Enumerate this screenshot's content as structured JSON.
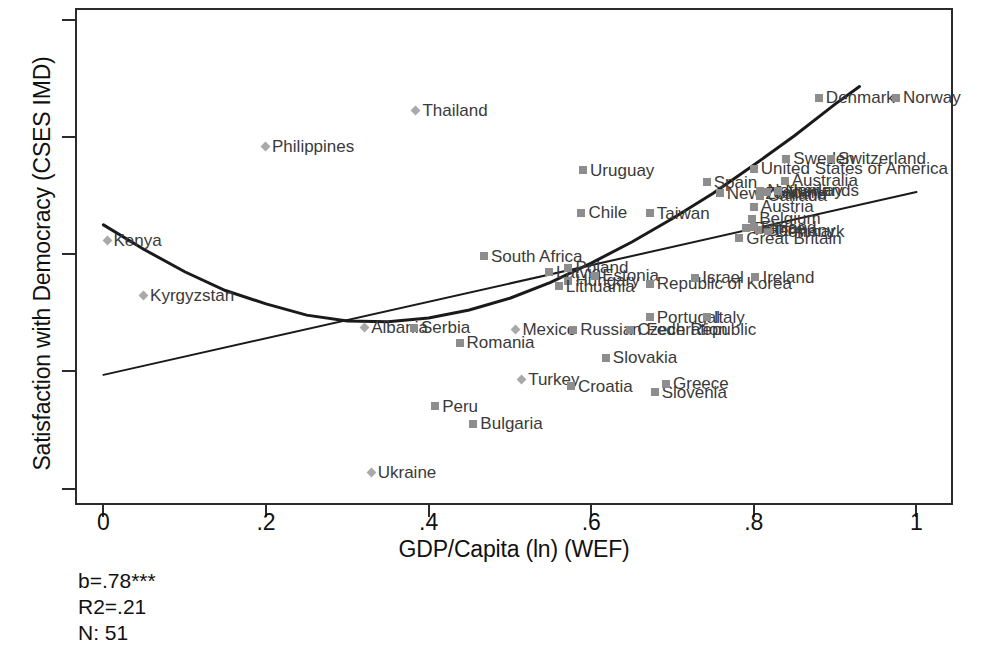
{
  "chart_data": {
    "type": "scatter",
    "title": "",
    "xlabel": "GDP/Capita (ln) (WEF)",
    "ylabel": "Satisfaction with Democracy (CSES IMD)",
    "xlim": [
      -0.035,
      1.045
    ],
    "ylim": [
      1.43,
      3.55
    ],
    "xticks": [
      "0",
      ".2",
      ".4",
      ".6",
      ".8",
      "1"
    ],
    "xtick_values": [
      0,
      0.2,
      0.4,
      0.6,
      0.8,
      1.0
    ],
    "yticks": [
      "1.5",
      "2",
      "2.5",
      "3",
      "3.5"
    ],
    "ytick_values": [
      1.5,
      2.0,
      2.5,
      3.0,
      3.5
    ],
    "grid": false,
    "legend": null,
    "marker_types": [
      "square",
      "diamond"
    ],
    "points": [
      {
        "label": "Kenya",
        "x": 0.005,
        "y": 2.555,
        "marker": "diamond",
        "label_pos": "right"
      },
      {
        "label": "Kyrgyzstan",
        "x": 0.05,
        "y": 2.32,
        "marker": "diamond",
        "label_pos": "right"
      },
      {
        "label": "Philippines",
        "x": 0.2,
        "y": 2.955,
        "marker": "diamond",
        "label_pos": "right"
      },
      {
        "label": "Thailand",
        "x": 0.385,
        "y": 3.11,
        "marker": "diamond",
        "label_pos": "right"
      },
      {
        "label": "Albania",
        "x": 0.322,
        "y": 2.185,
        "marker": "diamond",
        "label_pos": "right"
      },
      {
        "label": "Serbia",
        "x": 0.382,
        "y": 2.185,
        "marker": "square",
        "label_pos": "right"
      },
      {
        "label": "Romania",
        "x": 0.438,
        "y": 2.12,
        "marker": "square",
        "label_pos": "right"
      },
      {
        "label": "Peru",
        "x": 0.408,
        "y": 1.85,
        "marker": "square",
        "label_pos": "right"
      },
      {
        "label": "Bulgaria",
        "x": 0.455,
        "y": 1.775,
        "marker": "square",
        "label_pos": "right"
      },
      {
        "label": "Ukraine",
        "x": 0.33,
        "y": 1.565,
        "marker": "diamond",
        "label_pos": "right"
      },
      {
        "label": "Turkey",
        "x": 0.515,
        "y": 1.965,
        "marker": "diamond",
        "label_pos": "right"
      },
      {
        "label": "Mexico",
        "x": 0.508,
        "y": 2.175,
        "marker": "diamond",
        "label_pos": "right"
      },
      {
        "label": "South Africa",
        "x": 0.468,
        "y": 2.49,
        "marker": "square",
        "label_pos": "right"
      },
      {
        "label": "Latvia",
        "x": 0.548,
        "y": 2.42,
        "marker": "square",
        "label_pos": "right"
      },
      {
        "label": "Poland",
        "x": 0.572,
        "y": 2.44,
        "marker": "square",
        "label_pos": "right"
      },
      {
        "label": "Hungary",
        "x": 0.572,
        "y": 2.385,
        "marker": "square",
        "label_pos": "right"
      },
      {
        "label": "Lithuania",
        "x": 0.56,
        "y": 2.362,
        "marker": "square",
        "label_pos": "right"
      },
      {
        "label": "Estonia",
        "x": 0.605,
        "y": 2.405,
        "marker": "square",
        "label_pos": "right"
      },
      {
        "label": "Croatia",
        "x": 0.575,
        "y": 1.935,
        "marker": "square",
        "label_pos": "right"
      },
      {
        "label": "Uruguay",
        "x": 0.59,
        "y": 2.855,
        "marker": "square",
        "label_pos": "right"
      },
      {
        "label": "Chile",
        "x": 0.588,
        "y": 2.675,
        "marker": "square",
        "label_pos": "right"
      },
      {
        "label": "Russian Federation",
        "x": 0.578,
        "y": 2.175,
        "marker": "square",
        "label_pos": "right"
      },
      {
        "label": "Czech Republic",
        "x": 0.648,
        "y": 2.175,
        "marker": "square",
        "label_pos": "right"
      },
      {
        "label": "Slovakia",
        "x": 0.618,
        "y": 2.055,
        "marker": "square",
        "label_pos": "right"
      },
      {
        "label": "Slovenia",
        "x": 0.678,
        "y": 1.908,
        "marker": "square",
        "label_pos": "right"
      },
      {
        "label": "Greece",
        "x": 0.692,
        "y": 1.945,
        "marker": "square",
        "label_pos": "right"
      },
      {
        "label": "Portugal",
        "x": 0.672,
        "y": 2.228,
        "marker": "square",
        "label_pos": "right"
      },
      {
        "label": "Italy",
        "x": 0.742,
        "y": 2.228,
        "marker": "square",
        "label_pos": "right"
      },
      {
        "label": "Taiwan",
        "x": 0.672,
        "y": 2.672,
        "marker": "square",
        "label_pos": "right"
      },
      {
        "label": "Republic of Korea",
        "x": 0.672,
        "y": 2.372,
        "marker": "square",
        "label_pos": "right"
      },
      {
        "label": "Israel",
        "x": 0.728,
        "y": 2.398,
        "marker": "square",
        "label_pos": "right"
      },
      {
        "label": "Spain",
        "x": 0.742,
        "y": 2.805,
        "marker": "square",
        "label_pos": "right"
      },
      {
        "label": "New Zealand",
        "x": 0.758,
        "y": 2.758,
        "marker": "square",
        "label_pos": "right"
      },
      {
        "label": "Ireland",
        "x": 0.802,
        "y": 2.4,
        "marker": "square",
        "label_pos": "right"
      },
      {
        "label": "Great Britain",
        "x": 0.782,
        "y": 2.565,
        "marker": "square",
        "label_pos": "right"
      },
      {
        "label": "France",
        "x": 0.79,
        "y": 2.608,
        "marker": "square",
        "label_pos": "right"
      },
      {
        "label": "Germany",
        "x": 0.806,
        "y": 2.6,
        "marker": "square",
        "label_pos": "right"
      },
      {
        "label": "Denmark",
        "x": 0.818,
        "y": 2.596,
        "marker": "square",
        "label_pos": "right"
      },
      {
        "label": "Finland",
        "x": 0.8,
        "y": 2.612,
        "marker": "square",
        "label_pos": "right"
      },
      {
        "label": "Belgium",
        "x": 0.798,
        "y": 2.648,
        "marker": "square",
        "label_pos": "right"
      },
      {
        "label": "Austria",
        "x": 0.8,
        "y": 2.7,
        "marker": "square",
        "label_pos": "right"
      },
      {
        "label": "Canada",
        "x": 0.808,
        "y": 2.748,
        "marker": "square",
        "label_pos": "right"
      },
      {
        "label": "Netherlands",
        "x": 0.808,
        "y": 2.768,
        "marker": "square",
        "label_pos": "right"
      },
      {
        "label": "Japan",
        "x": 0.816,
        "y": 2.762,
        "marker": "square",
        "label_pos": "right"
      },
      {
        "label": "Norway",
        "x": 0.83,
        "y": 2.768,
        "marker": "square",
        "label_pos": "right"
      },
      {
        "label": "Australia",
        "x": 0.838,
        "y": 2.812,
        "marker": "square",
        "label_pos": "right"
      },
      {
        "label": "United States of America",
        "x": 0.8,
        "y": 2.862,
        "marker": "square",
        "label_pos": "right"
      },
      {
        "label": "Sweden",
        "x": 0.84,
        "y": 2.905,
        "marker": "square",
        "label_pos": "right"
      },
      {
        "label": "Switzerland",
        "x": 0.895,
        "y": 2.905,
        "marker": "square",
        "label_pos": "right"
      },
      {
        "label": "Denmark",
        "x": 0.88,
        "y": 3.165,
        "marker": "square",
        "label_pos": "right"
      },
      {
        "label": "Norway",
        "x": 0.975,
        "y": 3.165,
        "marker": "square",
        "label_pos": "right"
      }
    ],
    "fit_lines": [
      {
        "name": "linear-fit",
        "kind": "linear",
        "points": [
          [
            0.0,
            1.985
          ],
          [
            1.0,
            2.765
          ]
        ]
      },
      {
        "name": "quadratic-fit",
        "kind": "quadratic",
        "points": [
          [
            0.0,
            2.625
          ],
          [
            0.05,
            2.52
          ],
          [
            0.1,
            2.425
          ],
          [
            0.15,
            2.345
          ],
          [
            0.2,
            2.288
          ],
          [
            0.25,
            2.24
          ],
          [
            0.3,
            2.215
          ],
          [
            0.35,
            2.212
          ],
          [
            0.4,
            2.228
          ],
          [
            0.45,
            2.262
          ],
          [
            0.5,
            2.312
          ],
          [
            0.55,
            2.38
          ],
          [
            0.6,
            2.462
          ],
          [
            0.65,
            2.552
          ],
          [
            0.7,
            2.652
          ],
          [
            0.75,
            2.76
          ],
          [
            0.8,
            2.88
          ],
          [
            0.85,
            3.005
          ],
          [
            0.9,
            3.14
          ],
          [
            0.93,
            3.215
          ]
        ]
      }
    ],
    "annotations": {
      "b": "b=.78***",
      "r2": "R2=.21",
      "n": "N: 51"
    },
    "colors": {
      "axis": "#2b2b2b",
      "marker_square": "#8d8d8d",
      "marker_diamond": "#a9a9a9",
      "label_text": "#3a3a3a",
      "curve": "#1a1a1a",
      "background": "#ffffff"
    }
  }
}
